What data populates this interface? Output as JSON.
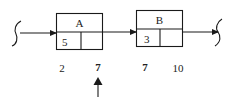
{
  "diagram": {
    "type": "linked-list-nodes",
    "nodes": [
      {
        "id": "A",
        "label": "A",
        "key": "5",
        "pointer": ""
      },
      {
        "id": "B",
        "label": "B",
        "key": "3",
        "pointer": ""
      }
    ],
    "edges": [
      {
        "from": "start-break",
        "to": "A"
      },
      {
        "from": "A",
        "to": "B"
      },
      {
        "from": "B",
        "to": "end-break"
      }
    ],
    "address_labels": [
      "2",
      "7",
      "7",
      "10"
    ],
    "pointer_marker": {
      "symbol": "up-arrow",
      "points_to_label_index": 1
    },
    "colors": {
      "stroke": "#1a1a1a",
      "text": "#222222",
      "background": "#ffffff"
    }
  }
}
